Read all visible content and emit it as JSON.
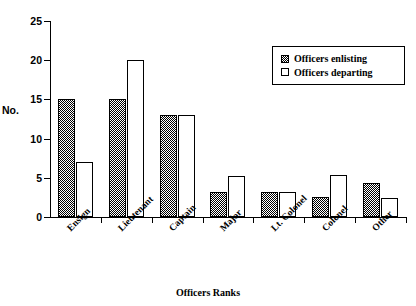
{
  "chart_data": {
    "type": "bar",
    "title": "",
    "subtitle": "",
    "xlabel": "Officers Ranks",
    "ylabel": "No.",
    "ylim": [
      0,
      25
    ],
    "yticks": [
      0,
      5,
      10,
      15,
      20,
      25
    ],
    "grid": false,
    "legend_position": "top-right",
    "categories": [
      "Ensign",
      "Lieutenant",
      "Captain",
      "Major",
      "Lt. Colonel",
      "Colonel",
      "Other"
    ],
    "series": [
      {
        "name": "Officers enlisting",
        "fill": "checkered-hatch",
        "values": [
          15,
          15,
          13,
          3.2,
          3.2,
          2.5,
          4.4
        ]
      },
      {
        "name": "Officers departing",
        "fill": "white",
        "values": [
          7,
          20,
          13,
          5.2,
          3.2,
          5.3,
          2.4
        ]
      }
    ]
  },
  "legend": {
    "items": [
      {
        "label": "Officers enlisting"
      },
      {
        "label": "Officers departing"
      }
    ]
  },
  "colors": {
    "axis": "#000000",
    "bar_outline": "#000000",
    "enlisting_fill": "#808080",
    "departing_fill": "#ffffff",
    "background": "#ffffff"
  }
}
